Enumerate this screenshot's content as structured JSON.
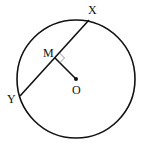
{
  "diagram": {
    "type": "geometry",
    "labels": {
      "X": "X",
      "Y": "Y",
      "M": "M",
      "O": "O"
    },
    "colors": {
      "stroke": "#111111",
      "right_angle_marker": "#888888"
    }
  }
}
